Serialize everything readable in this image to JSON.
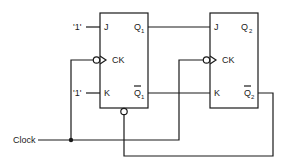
{
  "diagram": {
    "type": "jk-flip-flop-counter",
    "inputs": {
      "clock_label": "Clock",
      "j1_label": "'1'",
      "k1_label": "'1'"
    },
    "flipflop1": {
      "j": "J",
      "ck": "CK",
      "k": "K",
      "q": "Q",
      "q_sub": "1",
      "qbar": "Q",
      "qbar_sub": "1"
    },
    "flipflop2": {
      "j": "J",
      "ck": "CK",
      "k": "K",
      "q": "Q",
      "q_sub": "2",
      "qbar": "Q",
      "qbar_sub": "2"
    },
    "connections": [
      "Q1 -> J2",
      "Q1bar -> K2",
      "Clock -> CK1 (inverted)",
      "Clock -> CK2 (inverted)",
      "Q2bar -> FF1 bottom inverted input"
    ]
  }
}
